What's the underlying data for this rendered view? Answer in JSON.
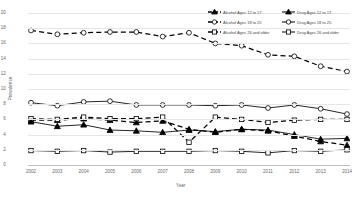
{
  "chart_data": {
    "type": "line",
    "title": "",
    "xlabel": "Year",
    "ylabel": "Prevalence",
    "x": [
      2002,
      2003,
      2004,
      2005,
      2006,
      2007,
      2008,
      2009,
      2010,
      2011,
      2012,
      2013,
      2014
    ],
    "categories": [
      "2002",
      "2003",
      "2004",
      "2005",
      "2006",
      "2007",
      "2008",
      "2009",
      "2010",
      "2011",
      "2012",
      "2013",
      "2014"
    ],
    "ylim": [
      0,
      20
    ],
    "yticks": [
      0,
      2,
      4,
      6,
      8,
      10,
      12,
      14,
      16,
      18,
      20
    ],
    "grid": true,
    "legend_position": "top-right",
    "series": [
      {
        "name": "Alcohol Ages 12 to 17",
        "marker": "triangle",
        "line": "dashed",
        "color": "#000000",
        "values": [
          5.9,
          5.9,
          6.1,
          5.9,
          5.6,
          5.8,
          4.7,
          4.3,
          4.7,
          4.5,
          3.8,
          3.1,
          2.6
        ]
      },
      {
        "name": "Alcohol Ages 18 to 25",
        "marker": "circle",
        "line": "dashed",
        "color": "#000000",
        "values": [
          17.7,
          17.2,
          17.4,
          17.5,
          17.5,
          16.9,
          17.4,
          16.0,
          15.7,
          14.5,
          14.3,
          13.0,
          12.3
        ]
      },
      {
        "name": "Alcohol Ages 26 and older",
        "marker": "square",
        "line": "dashed",
        "color": "#000000",
        "values": [
          6.1,
          6.0,
          6.3,
          6.1,
          6.1,
          6.3,
          3.0,
          6.3,
          6.0,
          5.6,
          5.9,
          6.0,
          6.0
        ]
      },
      {
        "name": "Drug Ages 12 to 17",
        "marker": "triangle",
        "line": "solid",
        "color": "#000000",
        "values": [
          5.7,
          5.1,
          5.3,
          4.6,
          4.5,
          4.3,
          4.6,
          4.4,
          4.7,
          4.6,
          4.0,
          3.4,
          3.5
        ]
      },
      {
        "name": "Drug Ages 18 to 25",
        "marker": "circle",
        "line": "solid",
        "color": "#000000",
        "values": [
          8.2,
          7.8,
          8.3,
          8.4,
          7.9,
          7.9,
          7.9,
          7.8,
          7.9,
          7.5,
          7.9,
          7.4,
          6.7
        ]
      },
      {
        "name": "Drug Ages 26 and older",
        "marker": "square",
        "line": "solid",
        "color": "#000000",
        "values": [
          1.9,
          1.8,
          1.9,
          1.7,
          1.8,
          1.8,
          1.8,
          1.9,
          1.8,
          1.6,
          1.9,
          1.8,
          2.0
        ]
      }
    ]
  },
  "legend": {
    "items": [
      {
        "label": "Alcohol Ages 12 to 17"
      },
      {
        "label": "Drug Ages 12 to 17"
      },
      {
        "label": "Alcohol Ages 18 to 25"
      },
      {
        "label": "Drug Ages 18 to 25"
      },
      {
        "label": "Alcohol Ages 26 and older"
      },
      {
        "label": "Drug Ages 26 and older"
      }
    ]
  }
}
